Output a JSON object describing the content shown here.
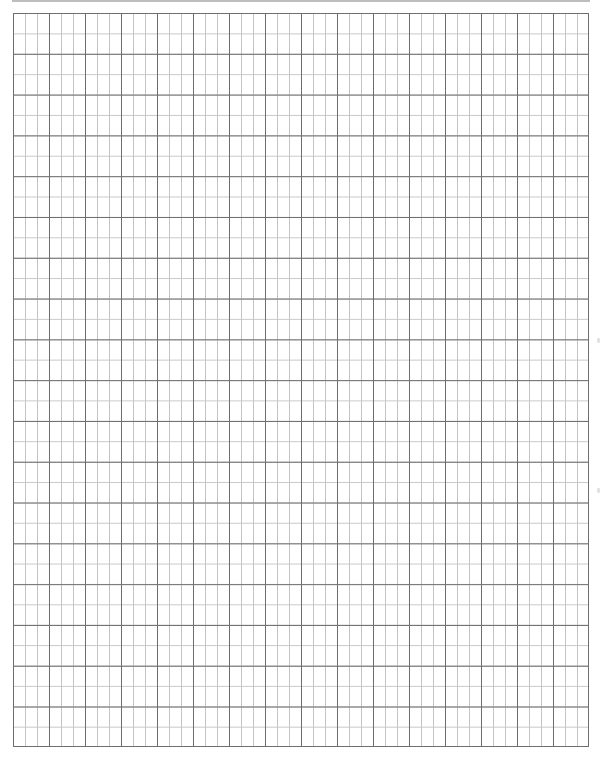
{
  "page": {
    "type": "graph-paper",
    "grid": {
      "major_columns": 16,
      "minor_per_major_x": 3,
      "major_rows": 18,
      "minor_per_major_y": 2,
      "major_line_color": "#6e6e6e",
      "minor_line_color": "#c4c4c4",
      "background_color": "#ffffff"
    },
    "top_rule_color": "#bdbdbd"
  }
}
